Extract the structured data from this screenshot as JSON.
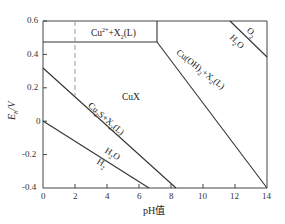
{
  "diagram": {
    "type": "Eh-pH (Pourbaix) diagram",
    "xlabel": "pH值",
    "ylabel": "Eh/V",
    "xlim": [
      0,
      14
    ],
    "ylim": [
      -0.4,
      0.6
    ],
    "x_ticks": [
      "0",
      "2",
      "4",
      "6",
      "8",
      "10",
      "12",
      "14"
    ],
    "y_ticks": [
      "0.6",
      "0.4",
      "0.2",
      "0",
      "-0.2",
      "-0.4"
    ],
    "regions": {
      "cu2_x2": "Cu2+ + X2(L)",
      "cux": "CuX",
      "cuoh2_x2": "Cu(OH)2 + X2(L)",
      "cu2s_x2": "Cu2S + X2(L)",
      "o2": "O2",
      "h2o_upper": "H2O",
      "h2o_lower": "H2O",
      "h2": "H2"
    },
    "lines": [
      {
        "name": "Cu2+/CuX boundary",
        "from": [
          0,
          0.47
        ],
        "to": [
          7.1,
          0.47
        ],
        "style": "solid"
      },
      {
        "name": "Cu2+/Cu(OH)2 boundary",
        "from": [
          7.1,
          0.6
        ],
        "to": [
          7.1,
          0.47
        ],
        "style": "solid"
      },
      {
        "name": "CuX/Cu(OH)2 boundary",
        "from": [
          7.1,
          0.47
        ],
        "to": [
          14,
          -0.4
        ],
        "style": "solid"
      },
      {
        "name": "CuX/Cu2S boundary",
        "from": [
          0,
          0.28
        ],
        "to": [
          8.3,
          -0.4
        ],
        "style": "solid"
      },
      {
        "name": "O2/H2O line",
        "from": [
          11.7,
          0.6
        ],
        "to": [
          14,
          0.38
        ],
        "style": "solid"
      },
      {
        "name": "H2O/H2 line",
        "from": [
          0,
          0.0
        ],
        "to": [
          6.6,
          -0.4
        ],
        "style": "solid"
      },
      {
        "name": "pH 2 reference",
        "from": [
          2,
          0.6
        ],
        "to": [
          2,
          0.15
        ],
        "style": "dashed"
      }
    ]
  }
}
